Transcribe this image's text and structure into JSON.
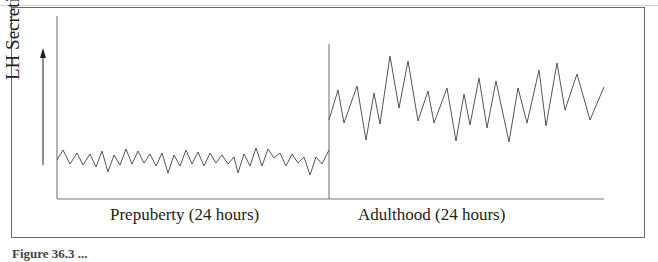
{
  "figure": {
    "y_axis_label": "LH Secretion",
    "x_labels": {
      "prepuberty": "Prepuberty (24 hours)",
      "adulthood": "Adulthood (24 hours)"
    },
    "caption": "Figure 36.3 ..."
  },
  "colors": {
    "line": "#555555",
    "axis": "#6a6a6a",
    "frame": "#6a6a6a"
  },
  "chart_data": {
    "type": "line",
    "title": "",
    "xlabel": "",
    "ylabel": "LH Secretion",
    "grid": false,
    "legend": null,
    "segments": [
      {
        "name": "Prepuberty (24 hours)",
        "description": "Low-amplitude, frequent pulsatile LH secretion",
        "points": [
          [
            57,
            160
          ],
          [
            63,
            150
          ],
          [
            70,
            164
          ],
          [
            77,
            153
          ],
          [
            83,
            165
          ],
          [
            90,
            154
          ],
          [
            96,
            167
          ],
          [
            102,
            151
          ],
          [
            108,
            172
          ],
          [
            114,
            155
          ],
          [
            120,
            165
          ],
          [
            126,
            149
          ],
          [
            132,
            164
          ],
          [
            138,
            151
          ],
          [
            144,
            163
          ],
          [
            150,
            154
          ],
          [
            156,
            166
          ],
          [
            162,
            153
          ],
          [
            168,
            173
          ],
          [
            174,
            155
          ],
          [
            180,
            166
          ],
          [
            186,
            150
          ],
          [
            192,
            164
          ],
          [
            198,
            152
          ],
          [
            204,
            166
          ],
          [
            210,
            153
          ],
          [
            216,
            163
          ],
          [
            222,
            155
          ],
          [
            228,
            164
          ],
          [
            234,
            157
          ],
          [
            238,
            173
          ],
          [
            244,
            154
          ],
          [
            250,
            166
          ],
          [
            256,
            148
          ],
          [
            262,
            166
          ],
          [
            268,
            149
          ],
          [
            274,
            158
          ],
          [
            280,
            153
          ],
          [
            286,
            166
          ],
          [
            292,
            154
          ],
          [
            298,
            163
          ],
          [
            304,
            157
          ],
          [
            310,
            175
          ],
          [
            316,
            157
          ],
          [
            322,
            164
          ],
          [
            329,
            150
          ]
        ]
      },
      {
        "name": "Adulthood (24 hours)",
        "description": "Higher-amplitude pulsatile LH secretion",
        "points": [
          [
            329,
            120
          ],
          [
            338,
            90
          ],
          [
            344,
            123
          ],
          [
            357,
            86
          ],
          [
            366,
            140
          ],
          [
            374,
            93
          ],
          [
            380,
            124
          ],
          [
            390,
            56
          ],
          [
            399,
            108
          ],
          [
            408,
            61
          ],
          [
            418,
            121
          ],
          [
            428,
            91
          ],
          [
            434,
            123
          ],
          [
            447,
            88
          ],
          [
            456,
            141
          ],
          [
            464,
            94
          ],
          [
            470,
            125
          ],
          [
            479,
            78
          ],
          [
            487,
            128
          ],
          [
            496,
            81
          ],
          [
            509,
            142
          ],
          [
            518,
            88
          ],
          [
            527,
            123
          ],
          [
            539,
            70
          ],
          [
            546,
            126
          ],
          [
            557,
            63
          ],
          [
            565,
            110
          ],
          [
            577,
            74
          ],
          [
            590,
            120
          ],
          [
            604,
            87
          ]
        ]
      }
    ],
    "axes": {
      "y_arrow": true,
      "divider_between_segments": true
    }
  }
}
